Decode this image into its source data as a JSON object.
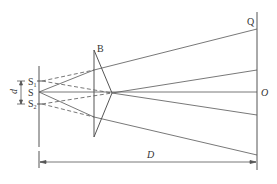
{
  "figure": {
    "colors": {
      "line": "#555555",
      "text": "#333333",
      "background": "#ffffff"
    }
  },
  "labels": {
    "source": "S",
    "source1_main": "S",
    "source1_sub": "1",
    "source2_main": "S",
    "source2_sub": "2",
    "biprism": "B",
    "screen_top": "Q",
    "screen_center": "O",
    "slit_separation": "d",
    "distance": "D"
  },
  "geometry": {
    "slit_plane_x": 39,
    "biprism_edge_x": 94,
    "biprism_apex_x": 112,
    "screen_x": 257,
    "axis_y": 92
  }
}
